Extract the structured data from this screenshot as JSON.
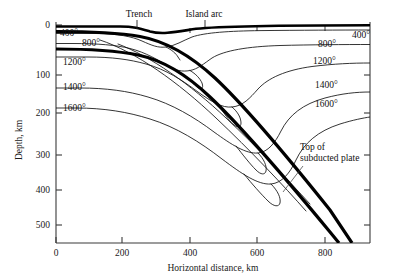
{
  "figure": {
    "kind": "geoscience-cross-section"
  },
  "axes": {
    "x": {
      "label": "Horizontal distance, km",
      "ticks": [
        0,
        200,
        400,
        600,
        800
      ],
      "tick_labels": [
        "0",
        "200",
        "400",
        "600",
        "800"
      ],
      "min": 0,
      "max": 940,
      "px_min": 56,
      "px_max": 370
    },
    "y": {
      "label": "Depth, km",
      "ticks": [
        0,
        100,
        200,
        300,
        400,
        500
      ],
      "tick_labels": [
        "0",
        "100",
        "200",
        "300",
        "400",
        "500"
      ],
      "min": 0,
      "max": 660,
      "px_min": 25,
      "px_max": 243
    }
  },
  "surface_labels": [
    {
      "text": "Trench",
      "x": 139,
      "y": 17,
      "tick_x": 137,
      "tick_y0": 20,
      "tick_y1": 28
    },
    {
      "text": "Island arc",
      "x": 204,
      "y": 17,
      "tick_x": 205,
      "tick_y0": 20,
      "tick_y1": 28
    }
  ],
  "annotation": {
    "line1": "Top of",
    "line2": "subducted plate",
    "x": 300,
    "y1": 150,
    "y2": 161,
    "leader": "M 303,166 L 283,192"
  },
  "isotherms": [
    {
      "value": "400°",
      "left_label_x": 60,
      "left_label_y": 36,
      "right_label_x": 352,
      "right_label_y": 38
    },
    {
      "value": "800°",
      "left_label_x": 82,
      "left_label_y": 46,
      "right_label_x": 318,
      "right_label_y": 47
    },
    {
      "value": "1200°",
      "left_label_x": 63,
      "left_label_y": 65,
      "right_label_x": 313,
      "right_label_y": 64
    },
    {
      "value": "1400°",
      "left_label_x": 63,
      "left_label_y": 90,
      "right_label_x": 315,
      "right_label_y": 88
    },
    {
      "value": "1600°",
      "left_label_x": 63,
      "left_label_y": 111,
      "right_label_x": 315,
      "right_label_y": 107
    }
  ],
  "chart_data": {
    "type": "line",
    "title": "",
    "xlabel": "Horizontal distance, km",
    "ylabel": "Depth, km",
    "xlim": [
      0,
      940
    ],
    "ylim": [
      660,
      0
    ],
    "grid": false,
    "legend": "inline-contour-labels",
    "series": [
      {
        "name": "400° isotherm",
        "kind": "contour",
        "value": 400
      },
      {
        "name": "800° isotherm",
        "kind": "contour",
        "value": 800
      },
      {
        "name": "1200° isotherm",
        "kind": "contour",
        "value": 1200
      },
      {
        "name": "1400° isotherm",
        "kind": "contour",
        "value": 1400
      },
      {
        "name": "1600° isotherm",
        "kind": "contour",
        "value": 1600
      },
      {
        "name": "Top of subducted plate",
        "kind": "boundary"
      }
    ],
    "paths": {
      "surface": "M 56,26.5 L 120,26.5 C 134,26.5 140,28.5 150,31.5 C 163,35 178,31.5 196,28.8 C 225,25.5 300,25.2 370,25.2",
      "slab_top": "M 56,31.5 C 95,31.5 120,33 140,36.5 C 165,41 190,55 215,78 C 245,106 290,160 330,210 L 352,243",
      "slab_bottom": "M 56,49 C 92,49 118,51 138,55 C 162,60 186,74 210,97 C 243,128 292,186 330,232 L 339,243",
      "iso400": "M 56,33.5 L 96,33.5 C 118,33.8 132,36.5 142,41 C 152,45.5 158,48 166,47 C 176,45.5 182,41 192,37 C 205,32.5 230,31 260,30.6 C 300,30.2 340,30 370,30",
      "iso400b": "M 166,47 C 172,50 176,53.5 178,57 L 180,60",
      "iso800": "M 56,43.5 L 72,43.5 C 98,43.5 116,45 130,48.5 C 146,52.5 158,60 168,66 C 176,70.5 182,72 190,70.5 C 198,69 204,63.5 212,58 C 224,50.5 248,46.5 280,45.5 C 310,44.7 345,44.5 370,44.5",
      "iso800_loop": "M 190,70.5 C 196,74 200,78.5 202,83 C 203,86 203,88 201,88.5 C 199,89 196,86.5 193,83",
      "iso1200": "M 56,57 L 88,57 C 112,57 130,59.5 146,64 C 166,69.5 182,80 198,92 C 212,102 222,108 232,107 C 243,106 250,98 258,89 C 268,78 286,70 312,66.5 C 334,63.8 352,63 370,63",
      "iso1200_loop": "M 232,107 C 238,112 241,118 241,123 C 241,127 238,128 234,125 C 230,122 226,116 222,110",
      "iso1400": "M 56,88 L 80,88 C 106,88 128,91 148,97 C 172,104 194,117 214,132 C 232,145 246,154 258,153 C 268,152 275,143 281,131 C 289,115 303,104 325,98 C 342,93.5 356,92 370,92",
      "iso1400_loop": "M 258,153 C 264,159 267,166 266,171 C 265,175 261,175 256,170 C 250,164 243,155 236,146",
      "iso1600": "M 56,108 L 76,108 C 104,108 128,112 150,119 C 176,127 200,142 222,159 C 242,174 258,185 271,184 C 282,183 290,173 296,160 C 304,143 318,131 340,124 C 353,120 363,118 370,117",
      "iso1600_loop": "M 271,184 C 278,191 281,198 280,203 C 279,207 274,207 268,201 C 261,194 252,184 244,174",
      "slab_iso_a": "M 118,44 C 150,56 190,84 226,118 C 258,148 288,180 310,204",
      "slab_iso_b": "M 100,40 C 136,52 178,82 216,118 C 250,150 284,186 306,211"
    }
  }
}
